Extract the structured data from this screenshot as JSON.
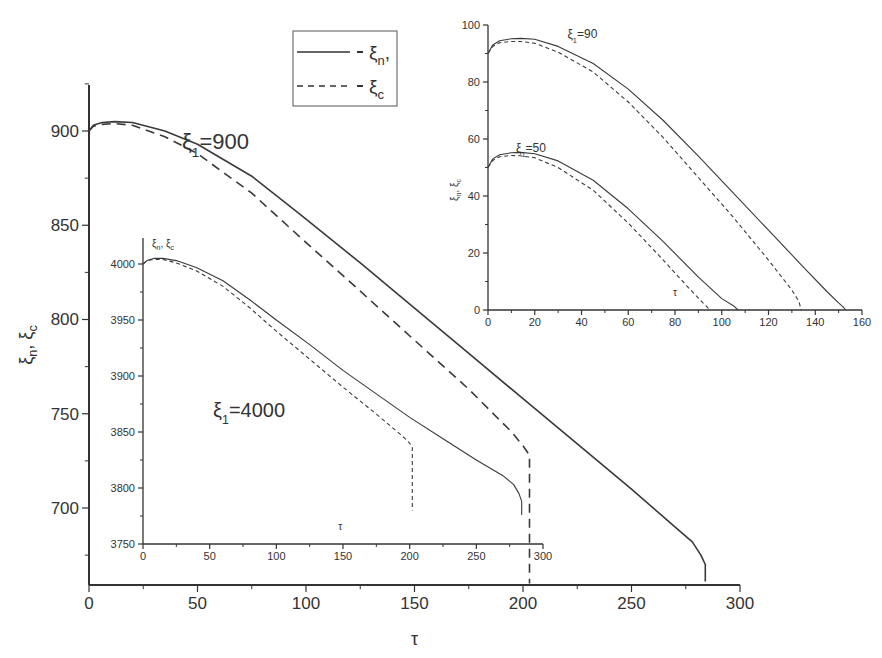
{
  "chart_data": [
    {
      "id": "main",
      "type": "line",
      "title": "",
      "annotation": {
        "sym": "ξ",
        "sub": "1",
        "text": "=900"
      },
      "xlabel": "τ",
      "ylabel": {
        "a": "ξ",
        "a_sub": "n",
        "sep": ", ",
        "b": "ξ",
        "b_sub": "c"
      },
      "xlim": [
        0,
        300
      ],
      "ylim": [
        675,
        925
      ],
      "xticks": [
        0,
        50,
        100,
        150,
        200,
        250,
        300
      ],
      "yticks": [
        700,
        750,
        800,
        850,
        900
      ],
      "grid": false,
      "legend": {
        "position": "top-center",
        "entries": [
          {
            "style": "solid",
            "label": "ξ",
            "sub": "n",
            "suffix": ","
          },
          {
            "style": "dashed",
            "label": "ξ",
            "sub": "c",
            "suffix": ""
          }
        ]
      },
      "series": [
        {
          "name": "ξn",
          "style": "solid",
          "x": [
            0,
            2,
            6,
            12,
            20,
            35,
            50,
            75,
            97,
            125,
            150,
            175,
            200,
            225,
            250,
            270,
            278,
            282,
            284,
            284
          ],
          "y": [
            900,
            903,
            904.5,
            905,
            904.5,
            900,
            893,
            876,
            856,
            830,
            806,
            782,
            758,
            734,
            710,
            690,
            682,
            675,
            670,
            661
          ]
        },
        {
          "name": "ξc",
          "style": "dashed",
          "x": [
            0,
            2,
            6,
            12,
            20,
            35,
            50,
            75,
            97,
            125,
            150,
            175,
            195,
            200,
            203,
            203
          ],
          "y": [
            900,
            902.5,
            903.5,
            904,
            903,
            897,
            888,
            867,
            844,
            815,
            789,
            763,
            740,
            733,
            728,
            660
          ]
        }
      ]
    },
    {
      "id": "inset_4000",
      "type": "line",
      "annotation": {
        "sym": "ξ",
        "sub": "1",
        "text": "=4000"
      },
      "xlabel": "τ",
      "ylabel": {
        "a": "ξ",
        "a_sub": "n",
        "sep": ", ",
        "b": "ξ",
        "b_sub": "c"
      },
      "xlim": [
        0,
        300
      ],
      "ylim": [
        3750,
        4025
      ],
      "xticks": [
        0,
        50,
        100,
        150,
        200,
        250,
        300
      ],
      "yticks": [
        3750,
        3800,
        3850,
        3900,
        3950,
        4000
      ],
      "grid": false,
      "series": [
        {
          "name": "ξn",
          "style": "solid",
          "x": [
            0,
            3,
            8,
            15,
            25,
            40,
            60,
            80,
            100,
            125,
            150,
            175,
            200,
            225,
            250,
            270,
            278,
            282,
            284,
            284
          ],
          "y": [
            4000,
            4003,
            4005,
            4005,
            4003,
            3997,
            3985,
            3968,
            3950,
            3928,
            3905,
            3884,
            3863,
            3844,
            3825,
            3811,
            3803,
            3795,
            3788,
            3776
          ]
        },
        {
          "name": "ξc",
          "style": "dashed",
          "x": [
            0,
            3,
            8,
            15,
            25,
            40,
            60,
            80,
            100,
            125,
            150,
            175,
            195,
            200,
            202,
            202
          ],
          "y": [
            4000,
            4003,
            4004,
            4004,
            4001,
            3994,
            3980,
            3961,
            3940,
            3915,
            3890,
            3866,
            3846,
            3840,
            3836,
            3780
          ]
        }
      ]
    },
    {
      "id": "inset_50_90",
      "type": "line",
      "xlabel": "τ",
      "ylabel": {
        "a": "ξ",
        "a_sub": "n",
        "sep": ", ",
        "b": "ξ",
        "b_sub": "c"
      },
      "xlim": [
        0,
        160
      ],
      "ylim": [
        0,
        100
      ],
      "xticks": [
        0,
        20,
        40,
        60,
        80,
        100,
        120,
        140,
        160
      ],
      "yticks": [
        0,
        20,
        40,
        60,
        80,
        100
      ],
      "grid": false,
      "annotations": [
        {
          "sym": "ξ",
          "sub": "1",
          "text": "=90",
          "x": 34,
          "y": 96
        },
        {
          "sym": "ξ",
          "sub": "1",
          "text": "=50",
          "x": 12,
          "y": 56
        }
      ],
      "series": [
        {
          "name": "ξn (ξ1=90)",
          "style": "solid",
          "x": [
            0,
            2,
            5,
            10,
            14,
            20,
            30,
            45,
            60,
            75,
            90,
            105,
            120,
            135,
            145,
            150,
            152,
            153
          ],
          "y": [
            90,
            93,
            94.5,
            95.2,
            95.3,
            95,
            92.5,
            86.5,
            77.5,
            66.5,
            54,
            41,
            28,
            15,
            6.5,
            2.5,
            1,
            0
          ]
        },
        {
          "name": "ξc (ξ1=90)",
          "style": "dashed",
          "x": [
            0,
            2,
            5,
            10,
            14,
            20,
            30,
            45,
            60,
            75,
            90,
            105,
            120,
            130,
            133,
            134
          ],
          "y": [
            90,
            92.5,
            93.8,
            94.2,
            94.2,
            93.6,
            90.5,
            83.5,
            73,
            60.5,
            46.5,
            32.5,
            17.5,
            7,
            3,
            0
          ]
        },
        {
          "name": "ξn (ξ1=50)",
          "style": "solid",
          "x": [
            0,
            2,
            5,
            10,
            14,
            20,
            30,
            45,
            60,
            75,
            90,
            100,
            105,
            107
          ],
          "y": [
            50,
            53,
            54.5,
            55.2,
            55.3,
            54.8,
            52.3,
            45.5,
            35.5,
            24,
            11.5,
            4,
            1.5,
            0
          ]
        },
        {
          "name": "ξc (ξ1=50)",
          "style": "dashed",
          "x": [
            0,
            2,
            5,
            10,
            14,
            20,
            30,
            45,
            60,
            75,
            85,
            92,
            95
          ],
          "y": [
            50,
            52.5,
            53.8,
            54.2,
            54.1,
            53.4,
            50,
            42,
            30.5,
            17.5,
            8.5,
            2.5,
            0
          ]
        }
      ]
    }
  ]
}
